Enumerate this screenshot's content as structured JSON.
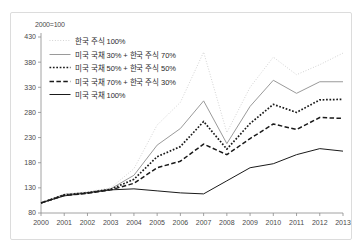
{
  "figure": {
    "axis_note": "2000=100",
    "colors": {
      "series_light_gray": "#c9c9c9",
      "series_gray": "#9a9a9a",
      "series_black": "#1a1a1a",
      "axis": "#8c8c8c",
      "border": "#dcdcdc",
      "text": "#4a4a4a"
    }
  },
  "legend": {
    "position": "top-left",
    "items": [
      {
        "label": "한국 주식 100%",
        "style": "fine-dotted",
        "color": "#c9c9c9"
      },
      {
        "label": "미국 국채 30% + 한국 주식 70%",
        "style": "solid",
        "color": "#9a9a9a"
      },
      {
        "label": "미국 국채 50% + 한국 주식 50%",
        "style": "bold-dotted",
        "color": "#1a1a1a"
      },
      {
        "label": "미국 국채 70% + 한국 주식 30%",
        "style": "dashed",
        "color": "#1a1a1a"
      },
      {
        "label": "미국 국채 100%",
        "style": "solid",
        "color": "#1a1a1a"
      }
    ]
  },
  "chart_data": {
    "type": "line",
    "title": "",
    "subtitle": "",
    "xlabel": "",
    "ylabel": "",
    "axis_note": "2000=100",
    "grid": false,
    "legend_position": "top-left",
    "x": [
      2000,
      2001,
      2002,
      2003,
      2004,
      2005,
      2006,
      2007,
      2008,
      2009,
      2010,
      2011,
      2012,
      2013
    ],
    "xlim": [
      2000,
      2013
    ],
    "xticks": [
      "2000",
      "2001",
      "2002",
      "2003",
      "2004",
      "2005",
      "2006",
      "2007",
      "2008",
      "2009",
      "2010",
      "2011",
      "2012",
      "2013"
    ],
    "ylim": [
      80,
      430
    ],
    "yticks": [
      80,
      130,
      180,
      230,
      280,
      330,
      380,
      430
    ],
    "series": [
      {
        "name": "한국 주식 100%",
        "style": "fine-dotted",
        "color": "#c9c9c9",
        "values": [
          100,
          118,
          122,
          130,
          168,
          255,
          300,
          400,
          240,
          330,
          390,
          355,
          375,
          398
        ]
      },
      {
        "name": "미국 국채 30% + 한국 주식 70%",
        "style": "solid",
        "color": "#9a9a9a",
        "values": [
          100,
          117,
          121,
          128,
          155,
          215,
          248,
          303,
          218,
          292,
          344,
          318,
          341,
          341
        ]
      },
      {
        "name": "미국 국채 50% + 한국 주식 50%",
        "style": "bold-dotted",
        "color": "#1a1a1a",
        "values": [
          100,
          116,
          120,
          127,
          147,
          192,
          212,
          262,
          207,
          258,
          296,
          280,
          305,
          306
        ]
      },
      {
        "name": "미국 국채 70% + 한국 주식 30%",
        "style": "dashed",
        "color": "#1a1a1a",
        "values": [
          100,
          115,
          119,
          126,
          139,
          170,
          183,
          217,
          196,
          228,
          257,
          246,
          270,
          268
        ]
      },
      {
        "name": "미국 국채 100%",
        "style": "solid",
        "color": "#1a1a1a",
        "values": [
          100,
          114,
          120,
          126,
          128,
          124,
          120,
          118,
          144,
          170,
          178,
          196,
          208,
          203
        ]
      }
    ]
  }
}
